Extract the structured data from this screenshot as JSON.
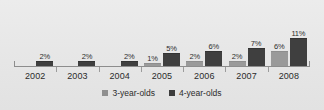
{
  "chart_data": {
    "type": "bar",
    "title": "",
    "xlabel": "",
    "ylabel": "",
    "categories": [
      "2002",
      "2003",
      "2004",
      "2005",
      "2006",
      "2007",
      "2008"
    ],
    "series": [
      {
        "name": "3-year-olds",
        "color": "#8f8f8f",
        "values": [
          0,
          0,
          0,
          1,
          2,
          2,
          6
        ],
        "labels": [
          "",
          "",
          "",
          "1%",
          "2%",
          "2%",
          "6%"
        ]
      },
      {
        "name": "4-year-olds",
        "color": "#3c3c3c",
        "values": [
          2,
          2,
          2,
          5,
          6,
          7,
          11
        ],
        "labels": [
          "2%",
          "2%",
          "2%",
          "5%",
          "6%",
          "7%",
          "11%"
        ]
      }
    ],
    "ylim": [
      0,
      11
    ],
    "grid": false,
    "legend_position": "bottom",
    "value_labels_shown": true
  },
  "legend": {
    "items": [
      {
        "label": "3-year-olds"
      },
      {
        "label": "4-year-olds"
      }
    ]
  },
  "axis": {
    "baseline_visible": true,
    "tick_count": 6
  }
}
